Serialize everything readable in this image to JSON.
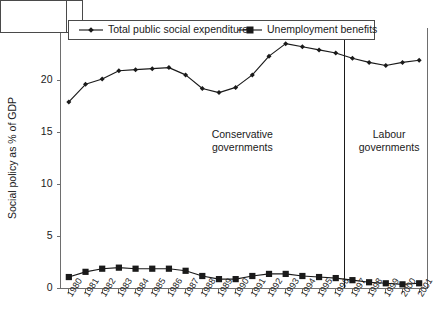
{
  "chart_data": {
    "type": "line",
    "title": "",
    "xlabel": "",
    "ylabel": "Social policy as % of GDP",
    "ylim": [
      0,
      25
    ],
    "ytick_labels": [
      "0",
      "5",
      "10",
      "15",
      "20",
      "25"
    ],
    "ytick_values": [
      0,
      5,
      10,
      15,
      20,
      25
    ],
    "grid": false,
    "legend_position": "top",
    "x": [
      1980,
      1981,
      1982,
      1983,
      1984,
      1985,
      1986,
      1987,
      1988,
      1989,
      1990,
      1991,
      1992,
      1993,
      1994,
      1995,
      1996,
      1997,
      1998,
      1999,
      2000,
      2001
    ],
    "categories": [
      "1980",
      "1981",
      "1982",
      "1983",
      "1984",
      "1985",
      "1986",
      "1987",
      "1988",
      "1989",
      "1990",
      "1991",
      "1992",
      "1993",
      "1994",
      "1995",
      "1996",
      "1997",
      "1998",
      "1999",
      "2000",
      "2001"
    ],
    "series": [
      {
        "name": "Total public social expenditure",
        "marker": "diamond",
        "color": "#1a1a1a",
        "values": [
          17.9,
          19.6,
          20.1,
          20.9,
          21.0,
          21.1,
          21.2,
          20.5,
          19.2,
          18.8,
          19.3,
          20.5,
          22.3,
          23.5,
          23.2,
          22.9,
          22.6,
          22.1,
          21.7,
          21.4,
          21.7,
          21.9
        ]
      },
      {
        "name": "Unemployment benefits",
        "marker": "square",
        "color": "#1a1a1a",
        "values": [
          1.1,
          1.6,
          1.9,
          2.0,
          1.9,
          1.9,
          1.9,
          1.7,
          1.2,
          0.9,
          0.9,
          1.2,
          1.4,
          1.4,
          1.2,
          1.1,
          1.0,
          0.8,
          0.6,
          0.5,
          0.4,
          0.5
        ]
      }
    ],
    "annotations": [
      {
        "id": "conservative",
        "lines": [
          "Conservative",
          "governments"
        ],
        "x_center": 1990.4,
        "y_center": 14.2
      },
      {
        "id": "labour",
        "lines": [
          "Labour",
          "governments"
        ],
        "x_center": 1999.2,
        "y_center": 14.2
      }
    ],
    "vertical_divider": {
      "label": "1997",
      "x": 1997
    }
  }
}
